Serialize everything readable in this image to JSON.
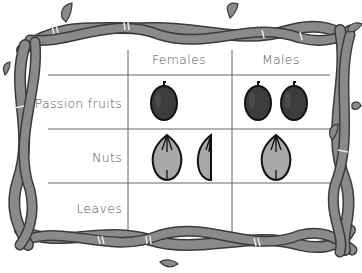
{
  "table": {
    "columns": [
      "",
      "Females",
      "Males"
    ],
    "rows": [
      {
        "label": "Passion fruits",
        "females": "1 whole passion fruit",
        "males": "2 whole passion fruits"
      },
      {
        "label": "Nuts",
        "females": "1 whole nut and 1 half nut",
        "males": "1 whole nut"
      },
      {
        "label": "Leaves",
        "females": "",
        "males": ""
      }
    ],
    "header": {
      "females": "Females",
      "males": "Males"
    },
    "labels": {
      "passion": "Passion fruits",
      "nuts": "Nuts",
      "leaves": "Leaves"
    }
  },
  "colors": {
    "vine": "#8a8a8a",
    "vine_outline": "#3a3a3a",
    "fruit": "#3d3d3d",
    "nut": "#a8a8a8",
    "grid": "#666666",
    "text": "#555555"
  },
  "icons": [
    "passion-fruit-icon",
    "nut-icon",
    "half-nut-icon",
    "vine-border"
  ]
}
